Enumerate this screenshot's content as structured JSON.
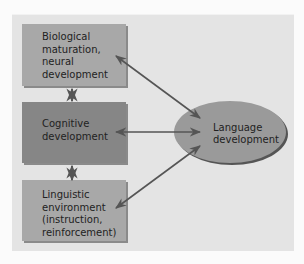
{
  "diagram": {
    "nodes": [
      {
        "id": "bio",
        "label_lines": [
          "Biological",
          "maturation,",
          "neural",
          "development"
        ]
      },
      {
        "id": "cog",
        "label_lines": [
          "Cognitive",
          "development"
        ]
      },
      {
        "id": "ling",
        "label_lines": [
          "Linguistic",
          "environment",
          "(instruction,",
          "reinforcement)"
        ]
      },
      {
        "id": "lang",
        "label_lines": [
          "Language",
          "development"
        ]
      }
    ],
    "edges": [
      {
        "from": "bio",
        "to": "cog",
        "type": "bidirectional"
      },
      {
        "from": "cog",
        "to": "ling",
        "type": "bidirectional"
      },
      {
        "from": "bio",
        "to": "lang",
        "type": "bidirectional"
      },
      {
        "from": "cog",
        "to": "lang",
        "type": "bidirectional"
      },
      {
        "from": "ling",
        "to": "lang",
        "type": "bidirectional"
      }
    ],
    "colors": {
      "background": "#e4e4e4",
      "box_light": "#a8a8a8",
      "box_dark": "#868686",
      "ellipse": "#9a9a9a",
      "arrow": "#555555"
    }
  }
}
